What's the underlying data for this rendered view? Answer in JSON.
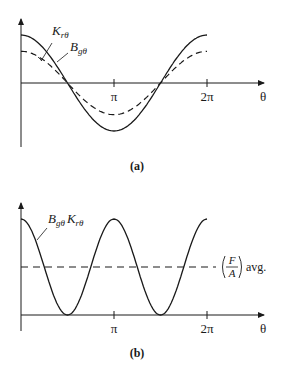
{
  "figure_a": {
    "caption": "(a)",
    "x_ticks": [
      "π",
      "2π"
    ],
    "x_axis_label": "θ",
    "curve_labels": {
      "solid": "K",
      "solid_sub": "rθ",
      "dashed": "B",
      "dashed_sub": "gθ"
    }
  },
  "figure_b": {
    "caption": "(b)",
    "x_ticks": [
      "π",
      "2π"
    ],
    "x_axis_label": "θ",
    "curve_label": {
      "b": "B",
      "b_sub": "gθ",
      "k": "K",
      "k_sub": "rθ"
    },
    "avg_label": {
      "num": "F",
      "den": "A",
      "suffix": "avg."
    }
  },
  "chart_data": [
    {
      "type": "line",
      "title": "(a)",
      "xlabel": "θ",
      "ylabel": "",
      "x_ticks": [
        "π",
        "2π"
      ],
      "series": [
        {
          "name": "Krθ",
          "style": "solid",
          "function": "cos(θ)",
          "amplitude": 1.0
        },
        {
          "name": "Bgθ",
          "style": "dashed",
          "function": "0.66·cos(θ)",
          "amplitude": 0.66
        }
      ],
      "xlim": [
        0,
        6.2832
      ]
    },
    {
      "type": "line",
      "title": "(b)",
      "xlabel": "θ",
      "ylabel": "",
      "x_ticks": [
        "π",
        "2π"
      ],
      "series": [
        {
          "name": "Bgθ Krθ",
          "style": "solid",
          "function": "cos²(θ)"
        },
        {
          "name": "(F/A) avg.",
          "style": "dashed",
          "function": "constant 0.5"
        }
      ],
      "xlim": [
        0,
        6.2832
      ]
    }
  ]
}
